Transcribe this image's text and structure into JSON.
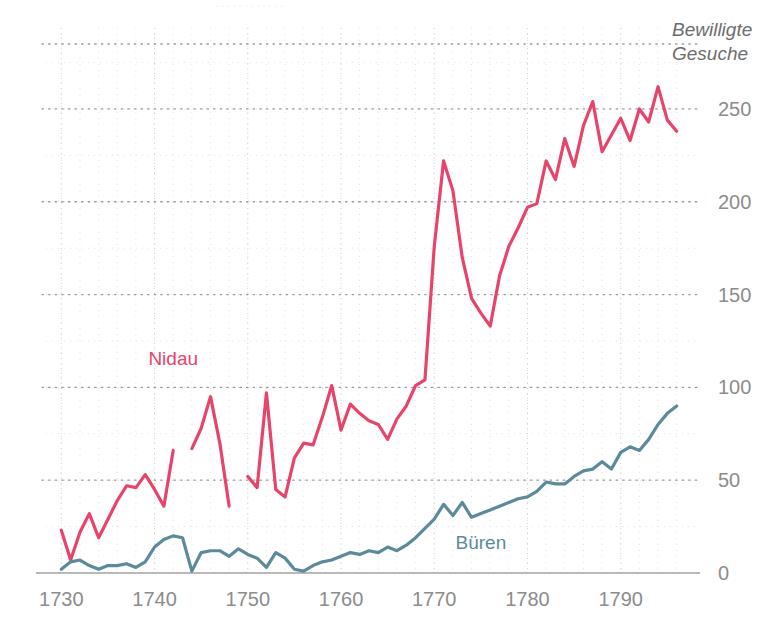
{
  "chart_data": {
    "type": "line",
    "title": "",
    "ylabel": "Bewilligte Gesuche",
    "xlabel": "",
    "xlim": [
      1729,
      1797
    ],
    "ylim": [
      0,
      285
    ],
    "y_major_ticks": [
      0,
      50,
      100,
      150,
      200,
      250
    ],
    "y_minor_step": 25,
    "x_major_ticks": [
      1730,
      1740,
      1750,
      1760,
      1770,
      1780,
      1790
    ],
    "x_minor_step": 2,
    "grid": true,
    "legend_position": "inline-annotation",
    "series": [
      {
        "name": "Nidau",
        "color": "#e8446b",
        "label_x": 1742,
        "label_y": 112,
        "x": [
          1730,
          1731,
          1732,
          1733,
          1734,
          1735,
          1736,
          1737,
          1738,
          1739,
          1740,
          1741,
          1742,
          1744,
          1745,
          1746,
          1747,
          1748,
          1750,
          1751,
          1752,
          1753,
          1754,
          1755,
          1756,
          1757,
          1758,
          1759,
          1760,
          1761,
          1762,
          1763,
          1764,
          1765,
          1766,
          1767,
          1768,
          1769,
          1770,
          1771,
          1772,
          1773,
          1774,
          1775,
          1776,
          1777,
          1778,
          1779,
          1780,
          1781,
          1782,
          1783,
          1784,
          1785,
          1786,
          1787,
          1788,
          1789,
          1790,
          1791,
          1792,
          1793,
          1794,
          1795,
          1796
        ],
        "values": [
          23,
          7,
          22,
          32,
          19,
          29,
          39,
          47,
          46,
          53,
          45,
          36,
          66,
          67,
          78,
          95,
          70,
          36,
          52,
          46,
          97,
          45,
          41,
          62,
          70,
          69,
          84,
          101,
          77,
          91,
          86,
          82,
          80,
          72,
          83,
          90,
          101,
          104,
          176,
          222,
          206,
          170,
          148,
          140,
          133,
          160,
          176,
          186,
          197,
          199,
          222,
          212,
          234,
          219,
          241,
          254,
          227,
          236,
          245,
          233,
          250,
          243,
          262,
          244,
          238
        ],
        "gaps": [
          [
            1742,
            1744
          ],
          [
            1748,
            1750
          ]
        ]
      },
      {
        "name": "Büren",
        "color": "#5d8a9b",
        "label_x": 1775,
        "label_y": 13,
        "x": [
          1730,
          1731,
          1732,
          1733,
          1734,
          1735,
          1736,
          1737,
          1738,
          1739,
          1740,
          1741,
          1742,
          1743,
          1744,
          1745,
          1746,
          1747,
          1748,
          1749,
          1750,
          1751,
          1752,
          1753,
          1754,
          1755,
          1756,
          1757,
          1758,
          1759,
          1760,
          1761,
          1762,
          1763,
          1764,
          1765,
          1766,
          1767,
          1768,
          1769,
          1770,
          1771,
          1772,
          1773,
          1774,
          1775,
          1776,
          1777,
          1778,
          1779,
          1780,
          1781,
          1782,
          1783,
          1784,
          1785,
          1786,
          1787,
          1788,
          1789,
          1790,
          1791,
          1792,
          1793,
          1794,
          1795,
          1796
        ],
        "values": [
          2,
          6,
          7,
          4,
          2,
          4,
          4,
          5,
          3,
          6,
          14,
          18,
          20,
          19,
          1,
          11,
          12,
          12,
          9,
          13,
          10,
          8,
          3,
          11,
          8,
          2,
          1,
          4,
          6,
          7,
          9,
          11,
          10,
          12,
          11,
          14,
          12,
          15,
          19,
          24,
          29,
          37,
          31,
          38,
          30,
          32,
          34,
          36,
          38,
          40,
          41,
          44,
          49,
          48,
          48,
          52,
          55,
          56,
          60,
          56,
          65,
          68,
          66,
          72,
          80,
          86,
          90
        ]
      }
    ]
  },
  "axis": {
    "y_title_line1": "Bewilligte",
    "y_title_line2": "Gesuche",
    "y_ticks": [
      "0",
      "50",
      "100",
      "150",
      "200",
      "250"
    ],
    "x_ticks": [
      "1730",
      "1740",
      "1750",
      "1760",
      "1770",
      "1780",
      "1790"
    ]
  },
  "annotations": {
    "nidau": "Nidau",
    "bueren": "Büren"
  },
  "colors": {
    "nidau": "#e8446b",
    "bueren": "#5d8a9b",
    "grid_major": "#9a9a9a",
    "grid_minor": "#e2e2e2",
    "baseline": "#b9b9b9",
    "tick_text": "#8c8c8c"
  },
  "ghost_top": "............"
}
